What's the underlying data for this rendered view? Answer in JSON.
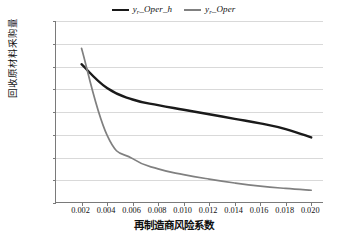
{
  "chart_data": {
    "type": "line",
    "title": "",
    "xlabel": "再制造商风险系数",
    "ylabel": "回收原材料采购量",
    "xlim": [
      0.0,
      0.021
    ],
    "ylim": [
      0,
      8000
    ],
    "grid": true,
    "legend_position": "top-center",
    "x_ticks": [
      "0.002",
      "0.004",
      "0.006",
      "0.008",
      "0.010",
      "0.012",
      "0.014",
      "0.016",
      "0.018",
      "0.020"
    ],
    "x_tick_values": [
      0.002,
      0.004,
      0.006,
      0.008,
      0.01,
      0.012,
      0.014,
      0.016,
      0.018,
      0.02
    ],
    "y_ticks": [
      "0",
      "1 000",
      "2 000",
      "3 000",
      "4 000",
      "5 000",
      "6 000",
      "7 000",
      "8 000"
    ],
    "y_tick_values": [
      0,
      1000,
      2000,
      3000,
      4000,
      5000,
      6000,
      7000,
      8000
    ],
    "x": [
      0.002,
      0.004,
      0.006,
      0.008,
      0.01,
      0.012,
      0.014,
      0.016,
      0.018,
      0.02
    ],
    "series": [
      {
        "name": "y_Oper_h",
        "name_base": "y",
        "name_sub": "r",
        "name_rest": "_Oper_h",
        "color": "#1a1a1a",
        "width": 2.4,
        "values": [
          6100,
          5050,
          4550,
          4300,
          4100,
          3900,
          3700,
          3500,
          3250,
          2880
        ]
      },
      {
        "name": "y_Oper",
        "name_base": "y",
        "name_sub": "r",
        "name_rest": "_Oper",
        "color": "#808080",
        "width": 1.7,
        "values": [
          6800,
          2980,
          1950,
          1500,
          1250,
          1050,
          880,
          740,
          640,
          560
        ]
      }
    ]
  },
  "legend": {
    "items": [
      {
        "label": "y_Oper_h",
        "base": "y",
        "sub": "r",
        "rest": "_Oper_h",
        "color": "#1a1a1a"
      },
      {
        "label": "y_Oper",
        "base": "y",
        "sub": "r",
        "rest": "_Oper",
        "color": "#808080"
      }
    ]
  }
}
